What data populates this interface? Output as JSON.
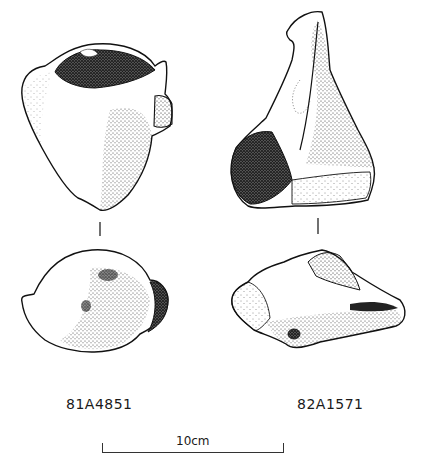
{
  "figure": {
    "type": "archaeological artifact line drawing",
    "specimens": [
      {
        "id": "81A4851",
        "views": [
          "side-view",
          "top-view"
        ]
      },
      {
        "id": "82A1571",
        "views": [
          "side-view",
          "top-view"
        ]
      }
    ],
    "scale": {
      "label": "10cm",
      "length_cm": 10
    }
  },
  "colors": {
    "ink": "#1a1a1a",
    "background": "#ffffff"
  }
}
